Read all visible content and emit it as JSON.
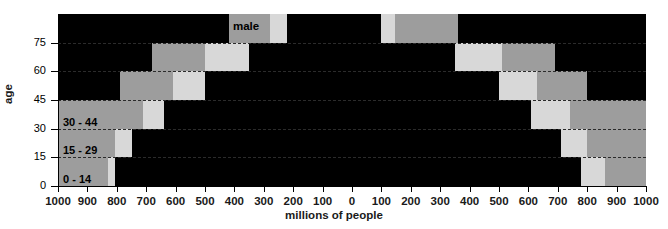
{
  "chart_data": {
    "type": "bar",
    "title": "",
    "subtitle": "",
    "xlabel": "millions of people",
    "ylabel": "age",
    "orientation": "horizontal-pyramid",
    "grid": true,
    "legend_position": "in-plot",
    "xlim": [
      -1000,
      1000
    ],
    "ylim": [
      0,
      90
    ],
    "x_tick_labels": [
      "1000",
      "900",
      "800",
      "700",
      "600",
      "500",
      "400",
      "300",
      "200",
      "100",
      "0",
      "100",
      "200",
      "300",
      "400",
      "500",
      "600",
      "700",
      "800",
      "900",
      "1000"
    ],
    "x_tick_values": [
      -1000,
      -900,
      -800,
      -700,
      -600,
      -500,
      -400,
      -300,
      -200,
      -100,
      0,
      100,
      200,
      300,
      400,
      500,
      600,
      700,
      800,
      900,
      1000
    ],
    "y_tick_labels": [
      "0",
      "15",
      "30",
      "45",
      "60",
      "75"
    ],
    "y_tick_values": [
      0,
      15,
      30,
      45,
      60,
      75
    ],
    "categories": [
      "0 - 14",
      "15 - 29",
      "30 - 44",
      "45 - 59",
      "60 - 74",
      "75 and older"
    ],
    "series_names": [
      "male",
      "female"
    ],
    "legend": [
      "male",
      "female"
    ],
    "annotations": [
      "male",
      "female"
    ],
    "band_names": [
      "inner",
      "middle",
      "outer"
    ],
    "band_colors": [
      "#000000",
      "#d8d8d8",
      "#9d9d9d"
    ],
    "series": [
      {
        "name": "male",
        "side": "left",
        "rows": [
          {
            "category": "0 - 14",
            "inner": 805,
            "middle": 830,
            "outer": 1000
          },
          {
            "category": "15 - 29",
            "inner": 750,
            "middle": 805,
            "outer": 1000
          },
          {
            "category": "30 - 44",
            "inner": 640,
            "middle": 710,
            "outer": 1000
          },
          {
            "category": "45 - 59",
            "inner": 500,
            "middle": 610,
            "outer": 790
          },
          {
            "category": "60 - 74",
            "inner": 350,
            "middle": 500,
            "outer": 680
          },
          {
            "category": "75 and older",
            "inner": 220,
            "middle": 280,
            "outer": 420
          }
        ]
      },
      {
        "name": "female",
        "side": "right",
        "rows": [
          {
            "category": "0 - 14",
            "inner": 780,
            "middle": 860,
            "outer": 1000
          },
          {
            "category": "15 - 29",
            "inner": 710,
            "middle": 800,
            "outer": 1000
          },
          {
            "category": "30 - 44",
            "inner": 610,
            "middle": 740,
            "outer": 1000
          },
          {
            "category": "45 - 59",
            "inner": 500,
            "middle": 630,
            "outer": 800
          },
          {
            "category": "60 - 74",
            "inner": 350,
            "middle": 510,
            "outer": 690
          },
          {
            "category": "75 and older",
            "inner": 100,
            "middle": 145,
            "outer": 360
          }
        ]
      }
    ]
  },
  "axis": {
    "x_title": "millions of people",
    "y_title": "age"
  },
  "labels": {
    "male": "male",
    "female": "female",
    "age_0_14": "0 - 14",
    "age_15_29": "15 - 29",
    "age_30_44": "30 - 44",
    "age_45_59": "45 - 59",
    "age_60_74": "60 - 74",
    "age_75_plus": "75 and older"
  },
  "ticks": {
    "y": [
      "0",
      "15",
      "30",
      "45",
      "60",
      "75"
    ],
    "x": [
      "1000",
      "900",
      "800",
      "700",
      "600",
      "500",
      "400",
      "300",
      "200",
      "100",
      "0",
      "100",
      "200",
      "300",
      "400",
      "500",
      "600",
      "700",
      "800",
      "900",
      "1000"
    ]
  },
  "colors": {
    "inner": "#000000",
    "middle": "#d8d8d8",
    "outer": "#9d9d9d",
    "background": "#ffffff",
    "axis": "#000000",
    "gridline": "#2b2b2b"
  }
}
